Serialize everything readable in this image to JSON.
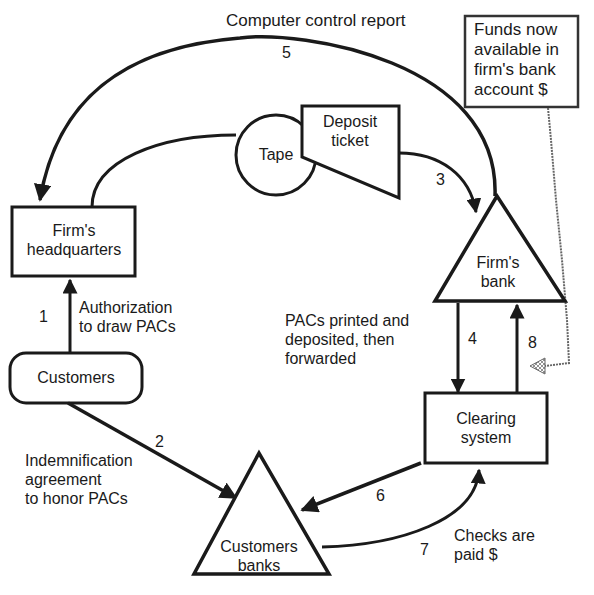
{
  "diagram": {
    "title": "Computer control report",
    "nodes": {
      "firm_hq": {
        "line1": "Firm's",
        "line2": "headquarters",
        "shape": "rectangle"
      },
      "tape": {
        "label": "Tape",
        "shape": "circle"
      },
      "customers": {
        "label": "Customers",
        "shape": "rounded-rectangle"
      },
      "deposit_ticket": {
        "line1": "Deposit",
        "line2": "ticket",
        "shape": "document"
      },
      "firms_bank": {
        "line1": "Firm's",
        "line2": "bank",
        "shape": "triangle"
      },
      "clearing_system": {
        "line1": "Clearing",
        "line2": "system",
        "shape": "rectangle"
      },
      "customers_banks": {
        "line1": "Customers",
        "line2": "banks",
        "shape": "triangle"
      },
      "funds_note": {
        "line1": "Funds now",
        "line2": "available in",
        "line3": "firm's bank",
        "line4": "account $",
        "shape": "annotation-box"
      }
    },
    "flows": [
      {
        "step": "1",
        "from": "Customers",
        "to": "Firm's headquarters",
        "line1": "Authorization",
        "line2": "to draw PACs"
      },
      {
        "step": "2",
        "from": "Customers",
        "to": "Customers banks",
        "line1": "Indemnification",
        "line2": "agreement",
        "line3": "to honor PACs"
      },
      {
        "step": "3",
        "from": "Deposit ticket",
        "to": "Firm's bank"
      },
      {
        "step": "4",
        "from": "Firm's bank",
        "to": "Clearing system",
        "line1": "PACs printed and",
        "line2": "deposited, then",
        "line3": "forwarded"
      },
      {
        "step": "5",
        "from": "Firm's bank",
        "to": "Firm's headquarters",
        "label": "Computer control report"
      },
      {
        "step": "6",
        "from": "Clearing system",
        "to": "Customers banks"
      },
      {
        "step": "7",
        "from": "Customers banks",
        "to": "Clearing system",
        "line1": "Checks are",
        "line2": "paid $"
      },
      {
        "step": "8",
        "from": "Clearing system",
        "to": "Firm's bank"
      }
    ],
    "colors": {
      "stroke": "#1a1a1a",
      "background": "#ffffff"
    }
  }
}
